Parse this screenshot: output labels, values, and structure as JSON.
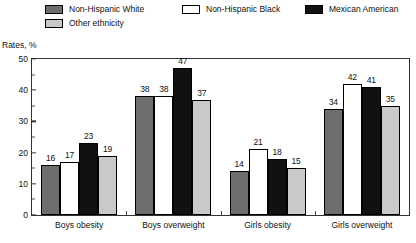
{
  "chart_data": {
    "type": "bar",
    "title": "",
    "subtitle": "",
    "xlabel": "",
    "ylabel": "Rates, %",
    "ylim": [
      0,
      50
    ],
    "yticks": [
      0,
      10,
      20,
      30,
      40,
      50
    ],
    "ytick_labels": [
      "0",
      "10",
      "20",
      "30",
      "40",
      "50"
    ],
    "yminor_step": 5,
    "grid": false,
    "legend_position": "top",
    "categories": [
      "Boys obesity",
      "Boys overweight",
      "Girls obesity",
      "Girls overweight"
    ],
    "series": [
      {
        "name": "Non-Hispanic White",
        "color": "#6e6e6e",
        "values": [
          16,
          38,
          14,
          34
        ]
      },
      {
        "name": "Non-Hispanic Black",
        "color": "#ffffff",
        "values": [
          17,
          38,
          21,
          42
        ]
      },
      {
        "name": "Mexican American",
        "color": "#111111",
        "values": [
          23,
          47,
          18,
          41
        ]
      },
      {
        "name": "Other ethnicity",
        "color": "#c9c9c9",
        "values": [
          19,
          37,
          15,
          35
        ]
      }
    ]
  },
  "legend": {
    "items": [
      {
        "label": "Non-Hispanic White",
        "color": "#6e6e6e"
      },
      {
        "label": "Other ethnicity",
        "color": "#c9c9c9"
      },
      {
        "label": "Non-Hispanic Black",
        "color": "#ffffff"
      },
      {
        "label": "Mexican American",
        "color": "#111111"
      }
    ]
  },
  "axis": {
    "y_caption": "Rates, %"
  }
}
